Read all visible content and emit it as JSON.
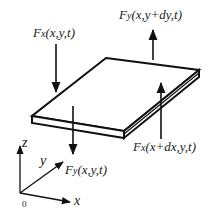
{
  "diagram": {
    "type": "free-body diagram of thin plate element",
    "forces": [
      {
        "id": "fx_left",
        "symbol": "F",
        "subscript": "x",
        "args": "(x,y,t)",
        "direction": "down"
      },
      {
        "id": "fy_top",
        "symbol": "F",
        "subscript": "y",
        "args": "(x,y+dy,t)",
        "direction": "up"
      },
      {
        "id": "fx_right",
        "symbol": "F",
        "subscript": "x",
        "args": "(x+dx,y,t)",
        "direction": "up"
      },
      {
        "id": "fy_bottom",
        "symbol": "F",
        "subscript": "y",
        "args": "(x,y,t)",
        "direction": "down"
      }
    ],
    "axes": {
      "x_label": "x",
      "y_label": "y",
      "z_label": "z",
      "origin_label": "0"
    },
    "colors": {
      "stroke": "#111111",
      "background": "#ffffff"
    }
  }
}
